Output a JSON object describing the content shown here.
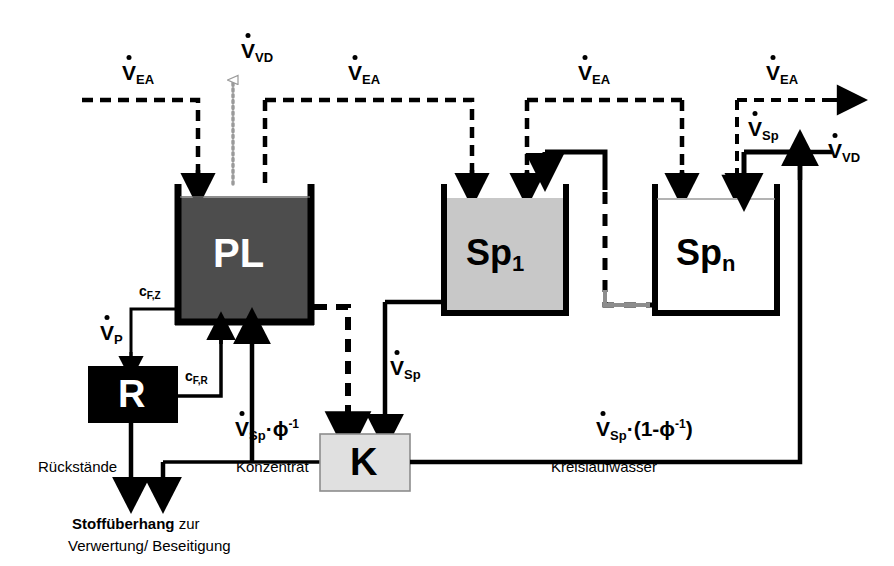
{
  "diagram": {
    "colors": {
      "pl_fill": "#4d4d4d",
      "sp1_fill": "#c8c8c8",
      "spn_fill": "#ffffff",
      "r_fill": "#000000",
      "k_fill": "#e0e0e0",
      "line": "#000000",
      "vd_line": "#9a9a9a"
    },
    "tanks": [
      {
        "id": "pl",
        "label": "PL",
        "sub": "",
        "fill": "#4d4d4d",
        "text_color": "#ffffff"
      },
      {
        "id": "sp1",
        "label": "Sp",
        "sub": "1",
        "fill": "#c8c8c8",
        "text_color": "#000000"
      },
      {
        "id": "spn",
        "label": "Sp",
        "sub": "n",
        "fill": "#ffffff",
        "text_color": "#000000"
      }
    ],
    "boxes": [
      {
        "id": "r",
        "label": "R",
        "fill": "#000000",
        "text_color": "#ffffff"
      },
      {
        "id": "k",
        "label": "K",
        "fill": "#e0e0e0",
        "text_color": "#000000"
      }
    ],
    "flow_labels": {
      "v_ea_1": {
        "sym": "V",
        "sub": "EA",
        "sup": ""
      },
      "v_ea_2": {
        "sym": "V",
        "sub": "EA",
        "sup": ""
      },
      "v_ea_3": {
        "sym": "V",
        "sub": "EA",
        "sup": ""
      },
      "v_ea_4": {
        "sym": "V",
        "sub": "EA",
        "sup": ""
      },
      "v_vd_top": {
        "sym": "V",
        "sub": "VD",
        "sup": ""
      },
      "v_vd_right": {
        "sym": "V",
        "sub": "VD",
        "sup": ""
      },
      "v_p": {
        "sym": "V",
        "sub": "P",
        "sup": ""
      },
      "v_sp_mid": {
        "sym": "V",
        "sub": "Sp",
        "sup": ""
      },
      "v_sp_right": {
        "sym": "V",
        "sub": "Sp",
        "sup": ""
      },
      "v_sp_phi": {
        "sym": "V",
        "sub": "Sp",
        "sup": "-1",
        "tail": "·ϕ"
      },
      "v_sp_circ": {
        "sym": "V",
        "sub": "Sp",
        "sup": "-1",
        "tail": "·(1-ϕ",
        "close": ")"
      }
    },
    "conc_labels": {
      "c_fz": {
        "sym": "c",
        "sub": "F,Z"
      },
      "c_fr": {
        "sym": "c",
        "sub": "F,R"
      }
    },
    "text_labels": {
      "rueckstaende": "Rückstände",
      "konzentrat": "Konzentrat",
      "kreislaufwasser": "Kreislaufwasser",
      "caption_bold": "Stoffüberhang",
      "caption_rest": " zur",
      "caption_line2": "Verwertung/ Beseitigung"
    }
  }
}
